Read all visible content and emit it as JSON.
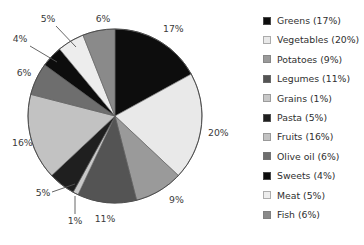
{
  "chart_data": {
    "type": "pie",
    "title": "",
    "legend_position": "right",
    "start_angle_deg": 0,
    "direction": "clockwise",
    "categories": [
      "Greens",
      "Vegetables",
      "Potatoes",
      "Legumes",
      "Grains",
      "Pasta",
      "Fruits",
      "Olive oil",
      "Sweets",
      "Meat",
      "Fish"
    ],
    "values": [
      17,
      20,
      9,
      11,
      1,
      5,
      16,
      6,
      4,
      5,
      6
    ],
    "value_unit": "%",
    "colors": [
      "#0d0d0d",
      "#e9e9e9",
      "#9a9a9a",
      "#545454",
      "#c8c8c8",
      "#1f1f1f",
      "#c2c2c2",
      "#6e6e6e",
      "#0d0d0d",
      "#ededed",
      "#8a8a8a"
    ],
    "slice_labels": [
      "17%",
      "20%",
      "9%",
      "11%",
      "1%",
      "5%",
      "16%",
      "6%",
      "4%",
      "5%",
      "6%"
    ],
    "legend_entries": [
      {
        "label": "Greens (17%)",
        "color": "#0d0d0d"
      },
      {
        "label": "Vegetables (20%)",
        "color": "#e9e9e9"
      },
      {
        "label": "Potatoes (9%)",
        "color": "#9a9a9a"
      },
      {
        "label": "Legumes (11%)",
        "color": "#545454"
      },
      {
        "label": "Grains (1%)",
        "color": "#c8c8c8"
      },
      {
        "label": "Pasta (5%)",
        "color": "#1f1f1f"
      },
      {
        "label": "Fruits (16%)",
        "color": "#c2c2c2"
      },
      {
        "label": "Olive oil (6%)",
        "color": "#6e6e6e"
      },
      {
        "label": "Sweets (4%)",
        "color": "#0d0d0d"
      },
      {
        "label": "Meat (5%)",
        "color": "#ededed"
      },
      {
        "label": "Fish (6%)",
        "color": "#8a8a8a"
      }
    ]
  },
  "geometry": {
    "cx": 115,
    "cy": 116,
    "r": 87
  },
  "labels": [
    {
      "text": "17%",
      "x": 163,
      "y": 32,
      "anchor": "start",
      "leader": null
    },
    {
      "text": "20%",
      "x": 208,
      "y": 136,
      "anchor": "start",
      "leader": null
    },
    {
      "text": "9%",
      "x": 169,
      "y": 203,
      "anchor": "start",
      "leader": null
    },
    {
      "text": "11%",
      "x": 105,
      "y": 222,
      "anchor": "middle",
      "leader": null
    },
    {
      "text": "1%",
      "x": 75,
      "y": 224,
      "anchor": "middle",
      "leader": [
        75,
        214,
        75,
        196
      ]
    },
    {
      "text": "5%",
      "x": 43,
      "y": 196,
      "anchor": "middle",
      "leader": [
        52,
        192,
        75,
        184
      ]
    },
    {
      "text": "16%",
      "x": 12,
      "y": 146,
      "anchor": "start",
      "leader": null
    },
    {
      "text": "6%",
      "x": 24,
      "y": 76,
      "anchor": "middle",
      "leader": null
    },
    {
      "text": "4%",
      "x": 20,
      "y": 42,
      "anchor": "middle",
      "leader": [
        30,
        46,
        57,
        62
      ]
    },
    {
      "text": "5%",
      "x": 48,
      "y": 22,
      "anchor": "middle",
      "leader": [
        56,
        26,
        76,
        47
      ]
    },
    {
      "text": "6%",
      "x": 103,
      "y": 22,
      "anchor": "middle",
      "leader": null
    }
  ]
}
